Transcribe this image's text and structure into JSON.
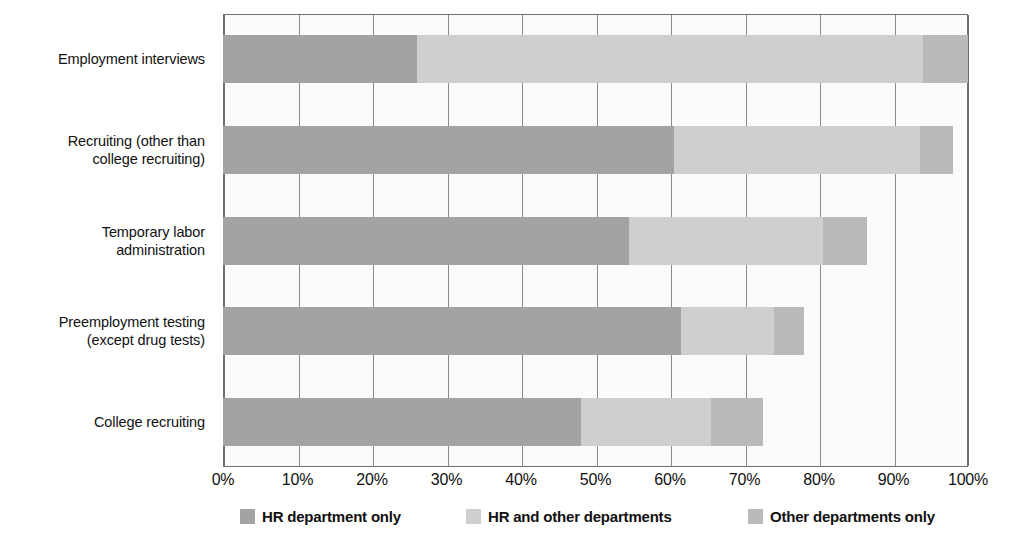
{
  "chart_data": {
    "type": "bar",
    "subtype": "stacked-horizontal-100",
    "title": "",
    "xlabel": "",
    "ylabel": "",
    "xlim": [
      0,
      100
    ],
    "grid": true,
    "legend_position": "bottom",
    "categories": [
      "Employment interviews",
      "Recruiting (other than college recruiting)",
      "Temporary labor administration",
      "Preemployment testing (except drug tests)",
      "College recruiting"
    ],
    "category_lines": [
      [
        "Employment interviews"
      ],
      [
        "Recruiting (other than",
        "college recruiting)"
      ],
      [
        "Temporary labor",
        "administration"
      ],
      [
        "Preemployment testing",
        "(except drug tests)"
      ],
      [
        "College recruiting"
      ]
    ],
    "series": [
      {
        "name": "HR department only",
        "color": "#a3a3a3",
        "values": [
          26,
          60.5,
          54.5,
          61.5,
          48
        ]
      },
      {
        "name": "HR and other departments",
        "color": "#cfcfcf",
        "values": [
          68,
          33,
          26,
          12.5,
          17.5
        ]
      },
      {
        "name": "Other departments only",
        "color": "#bababa",
        "values": [
          6,
          4.5,
          6,
          4,
          7
        ]
      }
    ],
    "totals": [
      100,
      98,
      86.5,
      78,
      72.5
    ],
    "xticks": [
      "0%",
      "10%",
      "20%",
      "30%",
      "40%",
      "50%",
      "60%",
      "70%",
      "80%",
      "90%",
      "100%"
    ],
    "xtick_values": [
      0,
      10,
      20,
      30,
      40,
      50,
      60,
      70,
      80,
      90,
      100
    ]
  },
  "legend": {
    "items": [
      {
        "label": "HR department only",
        "swatch": "sw-hr"
      },
      {
        "label": "HR and other departments",
        "swatch": "sw-both"
      },
      {
        "label": "Other departments only",
        "swatch": "sw-other"
      }
    ]
  },
  "colors": {
    "hr_only": "#a3a3a3",
    "hr_and_other": "#cfcfcf",
    "other_only": "#bababa",
    "plot_background": "#fbfbfa",
    "axis": "#6f6f6f",
    "grid": "#8a8a8a",
    "text": "#111111"
  }
}
